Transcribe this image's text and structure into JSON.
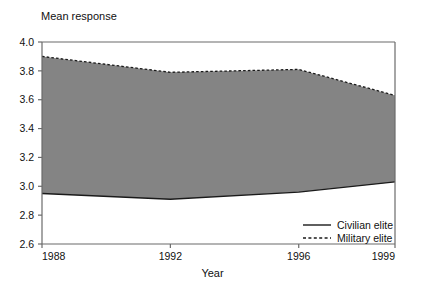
{
  "chart_data": {
    "type": "area",
    "title": "",
    "ylabel": "Mean response",
    "xlabel": "Year",
    "x": [
      1988,
      1992,
      1996,
      1999
    ],
    "xlim": [
      1988,
      1999
    ],
    "ylim": [
      2.6,
      4.0
    ],
    "xticks": [
      1988,
      1992,
      1996,
      1999
    ],
    "xticklabels": [
      "1988",
      "1992",
      "1996",
      "1999"
    ],
    "yticks": [
      2.6,
      2.8,
      3.0,
      3.2,
      3.4,
      3.6,
      3.8,
      4.0
    ],
    "yticklabels": [
      "2.6",
      "2.8",
      "3.0",
      "3.2",
      "3.4",
      "3.6",
      "3.8",
      "4.0"
    ],
    "grid": false,
    "legend_position": "lower right",
    "fill_between": true,
    "fill_color": "#848484",
    "series": [
      {
        "name": "Civilian elite",
        "style": "solid",
        "color": "#1a1a1a",
        "values": [
          2.95,
          2.91,
          2.96,
          3.03
        ]
      },
      {
        "name": "Military elite",
        "style": "dashed",
        "color": "#1a1a1a",
        "values": [
          3.9,
          3.79,
          3.81,
          3.63
        ]
      }
    ]
  },
  "legend": {
    "items": [
      {
        "label": "Civilian elite",
        "style": "solid"
      },
      {
        "label": "Military elite",
        "style": "dashed"
      }
    ]
  },
  "ticks": {
    "y": [
      "4.0",
      "3.8",
      "3.6",
      "3.4",
      "3.2",
      "3.0",
      "2.8",
      "2.6"
    ],
    "x": [
      "1988",
      "1992",
      "1996",
      "1999"
    ]
  },
  "labels": {
    "y_axis_title": "Mean response",
    "x_axis_title": "Year"
  }
}
